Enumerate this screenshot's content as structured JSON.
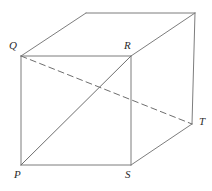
{
  "figure": {
    "type": "geometry-diagram",
    "canvas": {
      "width": 212,
      "height": 191,
      "background": "#ffffff"
    },
    "style": {
      "solid_edge_color": "#7d7d7d",
      "diagonal_color": "#6e6e6e",
      "dashed_edge_color": "#6e6e6e",
      "label_color": "#2b2b2b",
      "stroke_width": 1,
      "dash_pattern": "6 4"
    },
    "vertices": [
      {
        "id": "Q",
        "label": "Q",
        "x": 21,
        "y": 56,
        "label_x": 9,
        "label_y": 40,
        "visible_label": true
      },
      {
        "id": "R",
        "label": "R",
        "x": 131,
        "y": 56,
        "label_x": 124,
        "label_y": 40,
        "visible_label": true
      },
      {
        "id": "P",
        "label": "P",
        "x": 21,
        "y": 165,
        "label_x": 14,
        "label_y": 169,
        "visible_label": true
      },
      {
        "id": "S",
        "label": "S",
        "x": 131,
        "y": 165,
        "label_x": 125,
        "label_y": 169,
        "visible_label": true
      },
      {
        "id": "T",
        "label": "T",
        "x": 192,
        "y": 124,
        "label_x": 199,
        "label_y": 116,
        "visible_label": true
      },
      {
        "id": "A",
        "label": "",
        "x": 86,
        "y": 13,
        "label_x": 0,
        "label_y": 0,
        "visible_label": false
      },
      {
        "id": "B",
        "label": "",
        "x": 195,
        "y": 13,
        "label_x": 0,
        "label_y": 0,
        "visible_label": false
      }
    ],
    "edges": [
      {
        "name": "front-top-QR",
        "from": "Q",
        "to": "R",
        "style": "solid"
      },
      {
        "name": "front-left-QP",
        "from": "Q",
        "to": "P",
        "style": "solid"
      },
      {
        "name": "front-bottom-PS",
        "from": "P",
        "to": "S",
        "style": "solid"
      },
      {
        "name": "front-right-RS",
        "from": "R",
        "to": "S",
        "style": "solid"
      },
      {
        "name": "back-top-AB",
        "from": "A",
        "to": "B",
        "style": "solid"
      },
      {
        "name": "top-left-QA",
        "from": "Q",
        "to": "A",
        "style": "solid"
      },
      {
        "name": "top-right-RB",
        "from": "R",
        "to": "B",
        "style": "solid"
      },
      {
        "name": "right-vertical-BT",
        "from": "B",
        "to": "T",
        "style": "solid"
      },
      {
        "name": "bottom-right-ST",
        "from": "S",
        "to": "T",
        "style": "solid"
      },
      {
        "name": "face-diagonal-PR",
        "from": "P",
        "to": "R",
        "style": "solid"
      },
      {
        "name": "hidden-diagonal-QT",
        "from": "Q",
        "to": "T",
        "style": "dashed"
      }
    ]
  }
}
